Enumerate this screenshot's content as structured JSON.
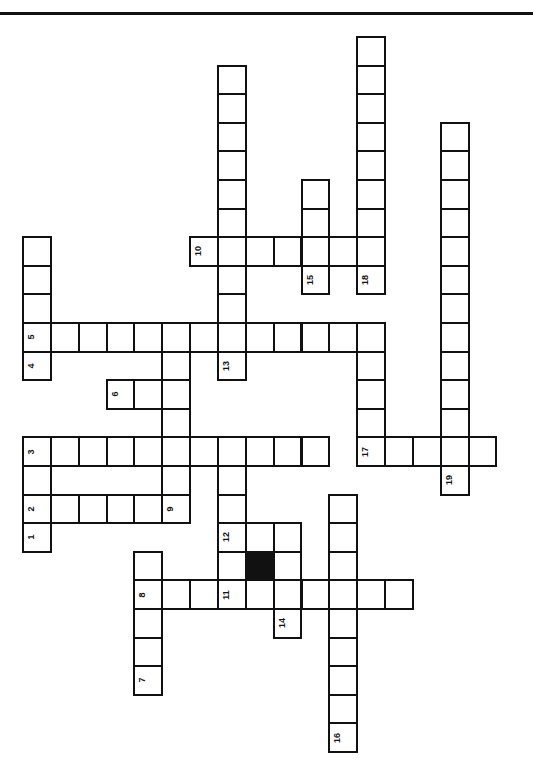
{
  "puzzle": {
    "type": "crossword",
    "orientation": "rotated-90",
    "grid_origin": {
      "x": 23,
      "y": 37
    },
    "cell_pitch": {
      "x": 27.85,
      "y": 28.6
    },
    "colors": {
      "line": "#111111",
      "background": "#ffffff",
      "block": "#111111"
    }
  },
  "cells": [
    {
      "c": 0,
      "r": 7
    },
    {
      "c": 0,
      "r": 8
    },
    {
      "c": 0,
      "r": 9
    },
    {
      "c": 0,
      "r": 10,
      "n": "5"
    },
    {
      "c": 0,
      "r": 11,
      "n": "4"
    },
    {
      "c": 0,
      "r": 14,
      "n": "3"
    },
    {
      "c": 0,
      "r": 15
    },
    {
      "c": 0,
      "r": 16,
      "n": "2"
    },
    {
      "c": 0,
      "r": 17,
      "n": "1"
    },
    {
      "c": 1,
      "r": 10
    },
    {
      "c": 2,
      "r": 10
    },
    {
      "c": 3,
      "r": 10
    },
    {
      "c": 4,
      "r": 10
    },
    {
      "c": 5,
      "r": 10
    },
    {
      "c": 6,
      "r": 10
    },
    {
      "c": 7,
      "r": 10
    },
    {
      "c": 8,
      "r": 10
    },
    {
      "c": 9,
      "r": 10
    },
    {
      "c": 10,
      "r": 10
    },
    {
      "c": 11,
      "r": 10
    },
    {
      "c": 12,
      "r": 10
    },
    {
      "c": 3,
      "r": 12,
      "n": "6"
    },
    {
      "c": 4,
      "r": 12
    },
    {
      "c": 5,
      "r": 12
    },
    {
      "c": 5,
      "r": 11
    },
    {
      "c": 5,
      "r": 13
    },
    {
      "c": 5,
      "r": 15
    },
    {
      "c": 5,
      "r": 16,
      "n": "9"
    },
    {
      "c": 1,
      "r": 14
    },
    {
      "c": 2,
      "r": 14
    },
    {
      "c": 3,
      "r": 14
    },
    {
      "c": 4,
      "r": 14
    },
    {
      "c": 5,
      "r": 14
    },
    {
      "c": 6,
      "r": 14
    },
    {
      "c": 7,
      "r": 14
    },
    {
      "c": 8,
      "r": 14
    },
    {
      "c": 9,
      "r": 14
    },
    {
      "c": 10,
      "r": 14
    },
    {
      "c": 1,
      "r": 16
    },
    {
      "c": 2,
      "r": 16
    },
    {
      "c": 3,
      "r": 16
    },
    {
      "c": 4,
      "r": 16
    },
    {
      "c": 7,
      "r": 1
    },
    {
      "c": 7,
      "r": 2
    },
    {
      "c": 7,
      "r": 3
    },
    {
      "c": 7,
      "r": 4
    },
    {
      "c": 7,
      "r": 5
    },
    {
      "c": 7,
      "r": 6
    },
    {
      "c": 7,
      "r": 7
    },
    {
      "c": 7,
      "r": 8
    },
    {
      "c": 7,
      "r": 9
    },
    {
      "c": 7,
      "r": 11,
      "n": "13"
    },
    {
      "c": 6,
      "r": 7,
      "n": "10"
    },
    {
      "c": 8,
      "r": 7
    },
    {
      "c": 9,
      "r": 7
    },
    {
      "c": 10,
      "r": 7
    },
    {
      "c": 11,
      "r": 7
    },
    {
      "c": 12,
      "r": 7
    },
    {
      "c": 10,
      "r": 5
    },
    {
      "c": 10,
      "r": 6
    },
    {
      "c": 10,
      "r": 8,
      "n": "15"
    },
    {
      "c": 12,
      "r": 0
    },
    {
      "c": 12,
      "r": 1
    },
    {
      "c": 12,
      "r": 2
    },
    {
      "c": 12,
      "r": 3
    },
    {
      "c": 12,
      "r": 4
    },
    {
      "c": 12,
      "r": 5
    },
    {
      "c": 12,
      "r": 6
    },
    {
      "c": 12,
      "r": 8,
      "n": "18"
    },
    {
      "c": 12,
      "r": 11
    },
    {
      "c": 12,
      "r": 12
    },
    {
      "c": 12,
      "r": 13
    },
    {
      "c": 12,
      "r": 14,
      "n": "17"
    },
    {
      "c": 13,
      "r": 14
    },
    {
      "c": 14,
      "r": 14
    },
    {
      "c": 15,
      "r": 14
    },
    {
      "c": 16,
      "r": 14
    },
    {
      "c": 15,
      "r": 3
    },
    {
      "c": 15,
      "r": 4
    },
    {
      "c": 15,
      "r": 5
    },
    {
      "c": 15,
      "r": 6
    },
    {
      "c": 15,
      "r": 7
    },
    {
      "c": 15,
      "r": 8
    },
    {
      "c": 15,
      "r": 9
    },
    {
      "c": 15,
      "r": 10
    },
    {
      "c": 15,
      "r": 11
    },
    {
      "c": 15,
      "r": 12
    },
    {
      "c": 15,
      "r": 13
    },
    {
      "c": 15,
      "r": 15,
      "n": "19"
    },
    {
      "c": 7,
      "r": 15
    },
    {
      "c": 7,
      "r": 16
    },
    {
      "c": 7,
      "r": 17,
      "n": "12"
    },
    {
      "c": 8,
      "r": 17
    },
    {
      "c": 9,
      "r": 17
    },
    {
      "c": 7,
      "r": 18
    },
    {
      "c": 8,
      "r": 18,
      "black": true
    },
    {
      "c": 9,
      "r": 18
    },
    {
      "c": 4,
      "r": 19,
      "n": "8"
    },
    {
      "c": 5,
      "r": 19
    },
    {
      "c": 6,
      "r": 19
    },
    {
      "c": 7,
      "r": 19,
      "n": "11"
    },
    {
      "c": 8,
      "r": 19
    },
    {
      "c": 9,
      "r": 19
    },
    {
      "c": 10,
      "r": 19
    },
    {
      "c": 11,
      "r": 19
    },
    {
      "c": 12,
      "r": 19
    },
    {
      "c": 13,
      "r": 19
    },
    {
      "c": 4,
      "r": 18
    },
    {
      "c": 4,
      "r": 20
    },
    {
      "c": 4,
      "r": 21
    },
    {
      "c": 4,
      "r": 22,
      "n": "7"
    },
    {
      "c": 9,
      "r": 20,
      "n": "14"
    },
    {
      "c": 11,
      "r": 16
    },
    {
      "c": 11,
      "r": 17
    },
    {
      "c": 11,
      "r": 18
    },
    {
      "c": 11,
      "r": 20
    },
    {
      "c": 11,
      "r": 21
    },
    {
      "c": 11,
      "r": 22
    },
    {
      "c": 11,
      "r": 23
    },
    {
      "c": 11,
      "r": 24,
      "n": "16"
    }
  ],
  "clue_numbers": [
    "1",
    "2",
    "3",
    "4",
    "5",
    "6",
    "7",
    "8",
    "9",
    "10",
    "11",
    "12",
    "13",
    "14",
    "15",
    "16",
    "17",
    "18",
    "19"
  ]
}
